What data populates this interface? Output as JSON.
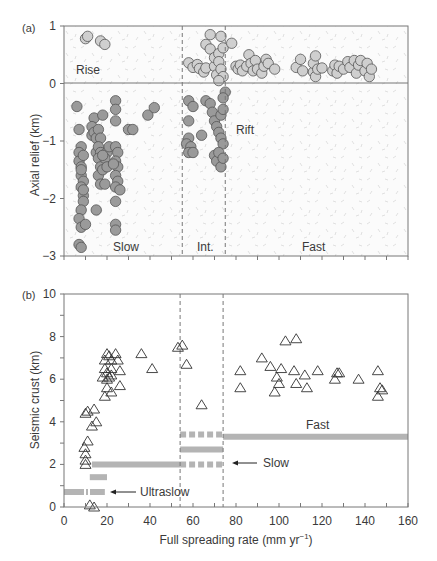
{
  "figure": {
    "panel_a_label": "(a)",
    "panel_b_label": "(b)",
    "xlabel": "Full spreading rate (mm yr",
    "xlabel_sup": "−1",
    "xlabel_close": ")"
  },
  "chart_data": [
    {
      "panel": "(a)",
      "type": "scatter",
      "title": "",
      "xlabel": "Full spreading rate (mm yr−1)",
      "ylabel": "Axial relief (km)",
      "xlim": [
        0,
        160
      ],
      "ylim": [
        -3,
        1
      ],
      "yticks": [
        "1",
        "0",
        "−1",
        "−2",
        "−3"
      ],
      "xticks_minor_every": 10,
      "grid": false,
      "regions": [
        {
          "label": "Rise",
          "x": 2,
          "y": 0.3
        },
        {
          "label": "Rift",
          "x": 78,
          "y": -0.6
        },
        {
          "label": "Slow",
          "x": 27,
          "y": -2.8
        },
        {
          "label": "Int.",
          "x": 63,
          "y": -2.8
        },
        {
          "label": "Fast",
          "x": 110,
          "y": -2.8
        }
      ],
      "dividers_x": [
        55,
        75
      ],
      "zero_line": 0,
      "series": [
        {
          "name": "Rise (light)",
          "color": "#cfcfcf",
          "points": [
            [
              10,
              0.78
            ],
            [
              11,
              0.82
            ],
            [
              17,
              0.74
            ],
            [
              19,
              0.68
            ],
            [
              58,
              0.36
            ],
            [
              60,
              0.28
            ],
            [
              62,
              0.33
            ],
            [
              63,
              0.26
            ],
            [
              65,
              0.2
            ],
            [
              66,
              0.27
            ],
            [
              66,
              0.68
            ],
            [
              68,
              0.85
            ],
            [
              68,
              0.6
            ],
            [
              70,
              0.3
            ],
            [
              70,
              0.45
            ],
            [
              71,
              0.15
            ],
            [
              72,
              0.52
            ],
            [
              72,
              0.38
            ],
            [
              73,
              0.82
            ],
            [
              73,
              0.25
            ],
            [
              74,
              0.12
            ],
            [
              74,
              0.62
            ],
            [
              72,
              0.05
            ],
            [
              78,
              0.7
            ],
            [
              80,
              0.3
            ],
            [
              81,
              0.25
            ],
            [
              82,
              0.32
            ],
            [
              83,
              0.22
            ],
            [
              85,
              0.3
            ],
            [
              86,
              0.5
            ],
            [
              87,
              0.35
            ],
            [
              88,
              0.22
            ],
            [
              89,
              0.4
            ],
            [
              90,
              0.25
            ],
            [
              92,
              0.18
            ],
            [
              93,
              0.3
            ],
            [
              94,
              0.42
            ],
            [
              95,
              0.35
            ],
            [
              98,
              0.25
            ],
            [
              108,
              0.28
            ],
            [
              110,
              0.42
            ],
            [
              111,
              0.22
            ],
            [
              116,
              0.2
            ],
            [
              116,
              0.35
            ],
            [
              117,
              0.48
            ],
            [
              117,
              0.12
            ],
            [
              118,
              0.25
            ],
            [
              120,
              0.27
            ],
            [
              125,
              0.22
            ],
            [
              126,
              0.32
            ],
            [
              127,
              0.18
            ],
            [
              128,
              0.3
            ],
            [
              130,
              0.25
            ],
            [
              132,
              0.38
            ],
            [
              133,
              0.28
            ],
            [
              135,
              0.4
            ],
            [
              136,
              0.18
            ],
            [
              137,
              0.32
            ],
            [
              138,
              0.4
            ],
            [
              140,
              0.22
            ],
            [
              141,
              0.35
            ],
            [
              142,
              0.12
            ],
            [
              143,
              0.25
            ]
          ]
        },
        {
          "name": "Rift (dark)",
          "color": "#9a9a9a",
          "points": [
            [
              6,
              -0.4
            ],
            [
              7,
              -0.8
            ],
            [
              8,
              -1.1
            ],
            [
              7,
              -1.2
            ],
            [
              7,
              -1.35
            ],
            [
              8,
              -1.45
            ],
            [
              8,
              -1.6
            ],
            [
              9,
              -1.7
            ],
            [
              8,
              -1.8
            ],
            [
              9,
              -1.95
            ],
            [
              9,
              -2.05
            ],
            [
              8,
              -2.2
            ],
            [
              7,
              -2.35
            ],
            [
              8,
              -2.5
            ],
            [
              10,
              -2.45
            ],
            [
              7,
              -2.8
            ],
            [
              8,
              -2.85
            ],
            [
              9,
              -1.25
            ],
            [
              8,
              -1.5
            ],
            [
              9,
              -1.85
            ],
            [
              14,
              -0.6
            ],
            [
              13,
              -0.75
            ],
            [
              13,
              -0.9
            ],
            [
              14,
              -0.85
            ],
            [
              15,
              -0.95
            ],
            [
              16,
              -0.8
            ],
            [
              17,
              -0.95
            ],
            [
              15,
              -1.2
            ],
            [
              16,
              -1.1
            ],
            [
              17,
              -1.2
            ],
            [
              16,
              -1.3
            ],
            [
              17,
              -1.45
            ],
            [
              16,
              -1.6
            ],
            [
              18,
              -1.5
            ],
            [
              17,
              -1.75
            ],
            [
              19,
              -1.75
            ],
            [
              20,
              -1.2
            ],
            [
              19,
              -1.3
            ],
            [
              20,
              -1.45
            ],
            [
              18,
              -1.25
            ],
            [
              21,
              -1.1
            ],
            [
              15,
              -2.2
            ],
            [
              18,
              -0.55
            ],
            [
              24,
              -0.3
            ],
            [
              24,
              -0.45
            ],
            [
              24,
              -0.65
            ],
            [
              24,
              -1.1
            ],
            [
              25,
              -1.2
            ],
            [
              24,
              -1.35
            ],
            [
              25,
              -1.45
            ],
            [
              24,
              -1.6
            ],
            [
              25,
              -1.7
            ],
            [
              24,
              -1.8
            ],
            [
              26,
              -1.85
            ],
            [
              23,
              -1.4
            ],
            [
              24,
              -2.05
            ],
            [
              24,
              -2.45
            ],
            [
              24,
              -2.55
            ],
            [
              30,
              -0.8
            ],
            [
              32,
              -0.8
            ],
            [
              39,
              -0.55
            ],
            [
              42,
              -0.42
            ],
            [
              58,
              -0.3
            ],
            [
              60,
              -0.4
            ],
            [
              58,
              -0.65
            ],
            [
              58,
              -0.95
            ],
            [
              57,
              -1.05
            ],
            [
              59,
              -1.1
            ],
            [
              58,
              -1.2
            ],
            [
              60,
              -1.2
            ],
            [
              64,
              -0.9
            ],
            [
              66,
              -0.3
            ],
            [
              68,
              -0.35
            ],
            [
              69,
              -0.5
            ],
            [
              70,
              -0.65
            ],
            [
              71,
              -0.75
            ],
            [
              72,
              -0.85
            ],
            [
              73,
              -0.95
            ],
            [
              74,
              -1.05
            ],
            [
              73,
              -0.55
            ],
            [
              74,
              -0.45
            ],
            [
              75,
              -0.15
            ],
            [
              74,
              -0.25
            ],
            [
              70,
              -1.25
            ],
            [
              71,
              -1.35
            ],
            [
              72,
              -1.2
            ],
            [
              73,
              -1.45
            ],
            [
              74,
              -1.3
            ]
          ]
        }
      ]
    },
    {
      "panel": "(b)",
      "type": "scatter",
      "title": "",
      "xlabel": "Full spreading rate (mm yr−1)",
      "ylabel": "Seismic crust (km)",
      "xlim": [
        0,
        160
      ],
      "ylim": [
        0,
        10
      ],
      "xticks": [
        "0",
        "20",
        "40",
        "60",
        "80",
        "100",
        "120",
        "140",
        "160"
      ],
      "yticks": [
        "0",
        "2",
        "4",
        "6",
        "8",
        "10"
      ],
      "dividers_x": [
        54,
        74
      ],
      "grid": false,
      "annotations": [
        {
          "label": "Ultraslow",
          "arrow_to": [
            20,
            0.7
          ]
        },
        {
          "label": "Slow",
          "arrow_to": [
            75,
            2.0
          ]
        },
        {
          "label": "Fast",
          "x": 113,
          "y": 3.7
        }
      ],
      "series": [
        {
          "name": "Seismic crust thickness",
          "marker": "triangle-open",
          "points": [
            [
              9.5,
              2.8
            ],
            [
              10,
              2.5
            ],
            [
              10,
              2.2
            ],
            [
              10,
              2.0
            ],
            [
              11,
              3.1
            ],
            [
              10,
              4.4
            ],
            [
              11,
              4.5
            ],
            [
              14,
              4.6
            ],
            [
              13,
              3.8
            ],
            [
              15,
              4.0
            ],
            [
              12,
              0.1
            ],
            [
              14,
              0.0
            ],
            [
              19,
              6.9
            ],
            [
              20,
              7.2
            ],
            [
              19,
              6.5
            ],
            [
              20,
              6.0
            ],
            [
              20,
              6.3
            ],
            [
              21,
              6.1
            ],
            [
              20,
              5.6
            ],
            [
              19,
              5.2
            ],
            [
              21,
              7.1
            ],
            [
              22,
              6.9
            ],
            [
              22,
              6.5
            ],
            [
              22,
              5.4
            ],
            [
              24,
              7.2
            ],
            [
              25,
              6.9
            ],
            [
              26,
              6.4
            ],
            [
              26,
              5.7
            ],
            [
              22,
              6.2
            ],
            [
              18,
              6.1
            ],
            [
              36,
              7.2
            ],
            [
              41,
              6.5
            ],
            [
              53,
              7.5
            ],
            [
              55,
              7.6
            ],
            [
              57,
              6.7
            ],
            [
              64,
              4.8
            ],
            [
              82,
              6.4
            ],
            [
              82,
              5.6
            ],
            [
              92,
              7.0
            ],
            [
              96,
              6.6
            ],
            [
              98,
              5.4
            ],
            [
              99,
              6.1
            ],
            [
              100,
              5.8
            ],
            [
              101,
              6.5
            ],
            [
              103,
              7.8
            ],
            [
              108,
              7.9
            ],
            [
              107,
              6.4
            ],
            [
              108,
              5.8
            ],
            [
              112,
              6.2
            ],
            [
              113,
              5.6
            ],
            [
              118,
              6.4
            ],
            [
              126,
              6.0
            ],
            [
              127,
              6.3
            ],
            [
              128,
              6.3
            ],
            [
              137,
              6.0
            ],
            [
              146,
              6.4
            ],
            [
              146,
              5.2
            ],
            [
              147,
              5.6
            ],
            [
              148,
              5.5
            ]
          ]
        }
      ],
      "bands": [
        {
          "name": "Ultraslow",
          "y": 0.7,
          "x": [
            0,
            19
          ],
          "style": "dash-dot"
        },
        {
          "name": "Ultraslow upper",
          "y": 1.4,
          "x": [
            12,
            20
          ],
          "style": "solid"
        },
        {
          "name": "Slow",
          "y": 2.0,
          "x": [
            13,
            54
          ],
          "style": "solid"
        },
        {
          "name": "Slow (int.)",
          "y": 2.0,
          "x": [
            54,
            74
          ],
          "style": "dashed"
        },
        {
          "name": "Intermediate",
          "y": 2.7,
          "x": [
            54,
            74
          ],
          "style": "solid"
        },
        {
          "name": "Fast (int.)",
          "y": 3.4,
          "x": [
            54,
            74
          ],
          "style": "dashed"
        },
        {
          "name": "Fast",
          "y": 3.3,
          "x": [
            74,
            160
          ],
          "style": "solid"
        }
      ]
    }
  ]
}
